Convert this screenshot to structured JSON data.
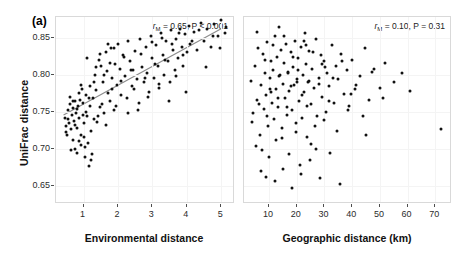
{
  "figure": {
    "panel_a_label": "(a)",
    "panel_b_label": "(b)",
    "y_axis_title": "UniFrac distance"
  },
  "chart_data": [
    {
      "type": "scatter",
      "panel": "(a)",
      "title": "",
      "xlabel": "Environmental distance",
      "ylabel": "UniFrac distance",
      "xlim": [
        0.2,
        5.4
      ],
      "ylim": [
        0.625,
        0.878
      ],
      "xticks": [
        1,
        2,
        3,
        4,
        5
      ],
      "yticks": [
        0.65,
        0.7,
        0.75,
        0.8,
        0.85
      ],
      "grid": true,
      "legend": "none",
      "annotation": "r_M = 0.65, P < 0.001",
      "stat_symbol": "r",
      "stat_subscript": "M",
      "stat_text_mid": " = 0.65, P < 0.001",
      "mantel_r": 0.65,
      "p_value": "< 0.001",
      "trendline": {
        "show": true,
        "color": "#8c8c8c",
        "x0": 0.42,
        "y0": 0.7455,
        "x1": 5.05,
        "y1": 0.8635
      },
      "x": [
        0.45,
        0.48,
        0.52,
        0.55,
        0.58,
        0.6,
        0.62,
        0.64,
        0.66,
        0.68,
        0.7,
        0.72,
        0.74,
        0.76,
        0.78,
        0.8,
        0.82,
        0.84,
        0.86,
        0.88,
        0.9,
        0.92,
        0.94,
        0.96,
        0.98,
        1.0,
        1.02,
        1.04,
        1.06,
        1.08,
        1.1,
        1.12,
        1.15,
        1.18,
        1.2,
        1.22,
        1.25,
        1.28,
        1.3,
        1.33,
        1.36,
        1.4,
        1.44,
        1.48,
        1.52,
        1.56,
        1.6,
        1.64,
        1.68,
        1.72,
        1.76,
        1.8,
        1.84,
        1.88,
        1.92,
        1.96,
        2.0,
        2.05,
        2.1,
        2.15,
        2.2,
        2.25,
        2.3,
        2.35,
        2.4,
        2.45,
        2.5,
        2.55,
        2.6,
        2.65,
        2.7,
        2.75,
        2.8,
        2.85,
        2.9,
        2.95,
        3.0,
        3.05,
        3.1,
        3.15,
        3.2,
        3.25,
        3.3,
        3.35,
        3.4,
        3.45,
        3.5,
        3.55,
        3.6,
        3.65,
        3.7,
        3.75,
        3.8,
        3.85,
        3.9,
        3.95,
        4.0,
        4.05,
        4.1,
        4.2,
        4.3,
        4.4,
        4.5,
        4.6,
        4.7,
        4.8,
        4.9,
        5.0,
        5.1,
        5.15,
        0.5,
        0.56,
        0.63,
        0.69,
        0.75,
        0.81,
        0.87,
        0.93,
        0.99,
        1.05,
        1.11,
        1.17,
        1.23,
        1.29,
        1.35,
        1.41,
        1.47,
        1.53,
        1.59,
        1.65,
        1.71,
        1.77,
        1.83,
        1.89,
        1.95,
        2.08,
        2.18,
        2.28,
        2.38,
        2.48,
        2.58,
        2.68,
        2.78,
        2.88,
        2.98,
        3.08,
        3.18,
        3.28,
        3.38,
        3.48,
        3.58,
        3.68,
        3.78,
        3.88,
        3.98,
        4.15,
        4.35,
        4.55,
        4.75,
        4.95
      ],
      "y": [
        0.742,
        0.731,
        0.718,
        0.752,
        0.735,
        0.77,
        0.76,
        0.726,
        0.745,
        0.712,
        0.755,
        0.737,
        0.7,
        0.765,
        0.748,
        0.728,
        0.694,
        0.758,
        0.741,
        0.775,
        0.766,
        0.719,
        0.705,
        0.78,
        0.762,
        0.734,
        0.716,
        0.688,
        0.75,
        0.772,
        0.744,
        0.708,
        0.676,
        0.784,
        0.757,
        0.724,
        0.692,
        0.768,
        0.74,
        0.8,
        0.779,
        0.736,
        0.82,
        0.756,
        0.812,
        0.79,
        0.748,
        0.83,
        0.805,
        0.775,
        0.764,
        0.836,
        0.795,
        0.752,
        0.815,
        0.786,
        0.841,
        0.808,
        0.772,
        0.826,
        0.798,
        0.768,
        0.845,
        0.818,
        0.784,
        0.806,
        0.832,
        0.794,
        0.762,
        0.848,
        0.81,
        0.79,
        0.838,
        0.802,
        0.776,
        0.852,
        0.822,
        0.795,
        0.84,
        0.812,
        0.782,
        0.856,
        0.826,
        0.8,
        0.845,
        0.818,
        0.79,
        0.86,
        0.834,
        0.806,
        0.848,
        0.822,
        0.862,
        0.838,
        0.812,
        0.855,
        0.83,
        0.866,
        0.842,
        0.858,
        0.834,
        0.87,
        0.846,
        0.862,
        0.838,
        0.868,
        0.852,
        0.874,
        0.856,
        0.864,
        0.722,
        0.74,
        0.698,
        0.764,
        0.732,
        0.754,
        0.71,
        0.786,
        0.746,
        0.702,
        0.822,
        0.768,
        0.684,
        0.79,
        0.81,
        0.744,
        0.828,
        0.76,
        0.8,
        0.732,
        0.842,
        0.816,
        0.78,
        0.836,
        0.758,
        0.792,
        0.824,
        0.748,
        0.806,
        0.78,
        0.752,
        0.828,
        0.796,
        0.77,
        0.844,
        0.814,
        0.788,
        0.85,
        0.82,
        0.764,
        0.842,
        0.798,
        0.856,
        0.826,
        0.776,
        0.846,
        0.86,
        0.81,
        0.852,
        0.836
      ]
    },
    {
      "type": "scatter",
      "panel": "(b)",
      "title": "",
      "xlabel": "Geographic distance (km)",
      "ylabel": "UniFrac distance",
      "xlim": [
        1,
        76
      ],
      "ylim": [
        0.625,
        0.878
      ],
      "xticks": [
        10,
        20,
        30,
        40,
        50,
        60,
        70
      ],
      "yticks": [
        0.65,
        0.7,
        0.75,
        0.8,
        0.85
      ],
      "grid": true,
      "legend": "none",
      "annotation": "r_M = 0.10, P = 0.31",
      "stat_symbol": "r",
      "stat_subscript": "M",
      "stat_text_mid": " = 0.10, P = 0.31",
      "mantel_r": 0.1,
      "p_value": "0.31",
      "trendline": {
        "show": false
      },
      "x": [
        3.5,
        4.2,
        5.0,
        5.6,
        6.2,
        6.8,
        7.2,
        7.8,
        8.2,
        8.6,
        9.0,
        9.4,
        9.8,
        10.2,
        10.6,
        11.0,
        11.4,
        11.8,
        12.2,
        12.6,
        13.0,
        13.4,
        13.8,
        14.2,
        14.6,
        15.0,
        15.4,
        15.8,
        16.2,
        16.6,
        17.0,
        17.4,
        17.8,
        18.2,
        18.6,
        19.0,
        19.4,
        19.8,
        20.2,
        20.6,
        21.0,
        21.4,
        21.8,
        22.2,
        22.6,
        23.0,
        23.4,
        23.8,
        24.2,
        24.6,
        25.0,
        25.6,
        26.2,
        26.8,
        27.4,
        28.0,
        28.6,
        29.2,
        29.8,
        30.4,
        31.0,
        31.8,
        32.6,
        33.4,
        34.2,
        35.0,
        36.0,
        37.0,
        38.0,
        39.0,
        40.0,
        41.5,
        43.0,
        44.5,
        46.0,
        48.0,
        50.0,
        52.0,
        55.0,
        58.0,
        61.0,
        72.0,
        4.0,
        5.4,
        6.5,
        7.5,
        8.4,
        9.2,
        10.0,
        10.8,
        11.6,
        12.4,
        13.2,
        14.0,
        14.8,
        15.6,
        16.4,
        17.2,
        18.0,
        18.8,
        19.6,
        20.4,
        21.2,
        22.0,
        22.8,
        23.6,
        24.4,
        25.2,
        26.0,
        27.0,
        28.0,
        29.0,
        30.0,
        31.5,
        33.0,
        34.5,
        36.5,
        38.5,
        41.0,
        44.0,
        47.0,
        51.0,
        5.8,
        7.0,
        8.8,
        10.4,
        12.0,
        13.6,
        15.2,
        16.8,
        18.4,
        20.0,
        21.6,
        23.2,
        24.8,
        26.6,
        28.4,
        30.2,
        32.0,
        35.5,
        39.5,
        45.0
      ],
      "y": [
        0.792,
        0.748,
        0.812,
        0.766,
        0.836,
        0.718,
        0.786,
        0.828,
        0.754,
        0.802,
        0.772,
        0.844,
        0.73,
        0.796,
        0.818,
        0.762,
        0.806,
        0.74,
        0.852,
        0.78,
        0.824,
        0.756,
        0.798,
        0.834,
        0.714,
        0.788,
        0.816,
        0.768,
        0.842,
        0.746,
        0.804,
        0.778,
        0.83,
        0.752,
        0.81,
        0.786,
        0.846,
        0.722,
        0.794,
        0.822,
        0.764,
        0.838,
        0.742,
        0.8,
        0.776,
        0.856,
        0.814,
        0.758,
        0.79,
        0.832,
        0.706,
        0.808,
        0.782,
        0.848,
        0.744,
        0.796,
        0.826,
        0.77,
        0.818,
        0.75,
        0.802,
        0.784,
        0.84,
        0.762,
        0.812,
        0.794,
        0.828,
        0.774,
        0.806,
        0.758,
        0.82,
        0.786,
        0.798,
        0.836,
        0.766,
        0.808,
        0.782,
        0.816,
        0.79,
        0.802,
        0.778,
        0.726,
        0.736,
        0.704,
        0.76,
        0.698,
        0.82,
        0.744,
        0.688,
        0.776,
        0.84,
        0.712,
        0.768,
        0.8,
        0.728,
        0.852,
        0.756,
        0.692,
        0.784,
        0.824,
        0.734,
        0.806,
        0.678,
        0.772,
        0.846,
        0.716,
        0.792,
        0.76,
        0.83,
        0.7,
        0.788,
        0.814,
        0.738,
        0.764,
        0.796,
        0.724,
        0.818,
        0.752,
        0.78,
        0.744,
        0.804,
        0.768,
        0.858,
        0.67,
        0.662,
        0.78,
        0.656,
        0.864,
        0.672,
        0.802,
        0.646,
        0.79,
        0.666,
        0.84,
        0.684,
        0.73,
        0.66,
        0.81,
        0.694,
        0.652,
        0.774,
        0.718
      ]
    }
  ]
}
